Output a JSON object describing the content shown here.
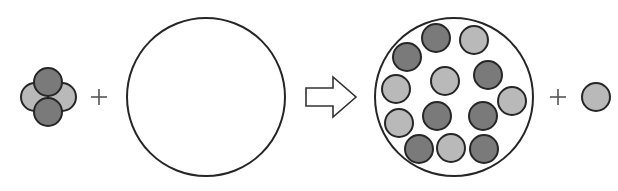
{
  "colors": {
    "dark": "#7a7a7a",
    "light": "#b9b9b9",
    "stroke": "#262626",
    "background": "#ffffff"
  },
  "diagram": {
    "reactant_cluster": {
      "particles": [
        {
          "x": 35,
          "y": 97,
          "r": 14,
          "shade": "light"
        },
        {
          "x": 62,
          "y": 97,
          "r": 14,
          "shade": "light"
        },
        {
          "x": 48,
          "y": 82,
          "r": 14,
          "shade": "dark"
        },
        {
          "x": 48,
          "y": 112,
          "r": 14,
          "shade": "dark"
        }
      ]
    },
    "plus_1": {
      "symbol": "+",
      "x": 99,
      "y": 97
    },
    "empty_container": {
      "x": 206,
      "y": 97,
      "r": 79
    },
    "arrow": {
      "symbol": "⇨",
      "x1": 306,
      "x2": 356,
      "y": 97
    },
    "filled_container": {
      "x": 454,
      "y": 97,
      "r": 79,
      "particles": [
        {
          "x": 436,
          "y": 38,
          "r": 14,
          "shade": "dark"
        },
        {
          "x": 474,
          "y": 40,
          "r": 14,
          "shade": "light"
        },
        {
          "x": 407,
          "y": 57,
          "r": 14,
          "shade": "dark"
        },
        {
          "x": 445,
          "y": 81,
          "r": 14,
          "shade": "light"
        },
        {
          "x": 488,
          "y": 75,
          "r": 14,
          "shade": "dark"
        },
        {
          "x": 396,
          "y": 89,
          "r": 14,
          "shade": "light"
        },
        {
          "x": 512,
          "y": 101,
          "r": 14,
          "shade": "light"
        },
        {
          "x": 437,
          "y": 116,
          "r": 14,
          "shade": "dark"
        },
        {
          "x": 483,
          "y": 116,
          "r": 14,
          "shade": "dark"
        },
        {
          "x": 399,
          "y": 123,
          "r": 14,
          "shade": "light"
        },
        {
          "x": 419,
          "y": 149,
          "r": 14,
          "shade": "dark"
        },
        {
          "x": 451,
          "y": 148,
          "r": 14,
          "shade": "light"
        },
        {
          "x": 484,
          "y": 149,
          "r": 14,
          "shade": "dark"
        }
      ]
    },
    "plus_2": {
      "symbol": "+",
      "x": 558,
      "y": 97
    },
    "product_particle": {
      "x": 596,
      "y": 97,
      "r": 14,
      "shade": "light"
    }
  }
}
